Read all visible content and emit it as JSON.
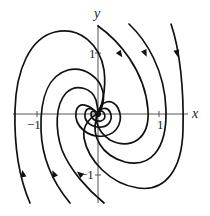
{
  "figure": {
    "axes": {
      "x_label": "x",
      "y_label": "y",
      "x_ticks": [
        {
          "value": -1,
          "label": "−1"
        },
        {
          "value": 1,
          "label": "1"
        }
      ],
      "y_ticks": [
        {
          "value": 1,
          "label": "1"
        },
        {
          "value": -1,
          "label": "−1"
        }
      ],
      "origin_px": [
        98,
        114
      ],
      "unit_px": 61,
      "x_range_px": [
        13,
        188
      ],
      "y_range_px": [
        25,
        203
      ]
    },
    "equilibrium": {
      "type": "spiral sink",
      "location": [
        0,
        0
      ]
    },
    "rotation": "counterclockwise",
    "colors": {
      "curve": "#111111",
      "axis": "#555555",
      "text": "#222222"
    },
    "trajectories": [
      {
        "id": "t1",
        "path": "M 98 26 C 118 40 145 70 148 110 C 150 140 130 150 110 140 C 95 130 95 116 98 114",
        "arrow": {
          "x": 120,
          "y": 54,
          "angle": 55
        }
      },
      {
        "id": "t2",
        "path": "M 129 24 C 146 40 165 70 166 110 C 167 150 150 168 125 162 C 100 155 92 135 96 120 C 97 116 98 114 98 114",
        "arrow": {
          "x": 145,
          "y": 53,
          "angle": 65
        }
      },
      {
        "id": "t3",
        "path": "M 171 24 C 180 50 184 90 183 130 C 182 170 165 192 138 188 C 110 184 88 160 84 138 C 82 124 92 116 98 114",
        "arrow": {
          "x": 177,
          "y": 53,
          "angle": 78
        }
      },
      {
        "id": "t4",
        "path": "M 30 203 C 20 180 14 150 15 110 C 16 70 30 38 55 32 C 80 26 100 45 104 70 C 107 92 100 110 98 114",
        "arrow": {
          "x": 23,
          "y": 174,
          "angle": -100
        }
      },
      {
        "id": "t5",
        "path": "M 70 203 C 55 185 42 160 41 130 C 40 95 50 75 68 70 C 85 66 100 78 103 92 C 105 104 100 112 98 114",
        "arrow": {
          "x": 54,
          "y": 174,
          "angle": -115
        }
      },
      {
        "id": "t6",
        "path": "M 104 203 C 88 190 70 170 62 150 C 55 130 55 105 66 93 C 76 83 92 88 96 100 C 98 108 98 112 98 114",
        "arrow": {
          "x": 80,
          "y": 174,
          "angle": -140
        }
      },
      {
        "id": "t7",
        "path": "M 98 114 C 90 105 78 100 76 112 C 74 126 88 138 104 136 C 118 134 124 120 118 108 C 112 98 100 100 98 114"
      },
      {
        "id": "t8",
        "path": "M 98 114 C 93 108 86 106 85 114 C 84 122 92 128 102 127 C 110 126 113 118 110 112 C 107 106 100 108 98 114"
      },
      {
        "id": "t9",
        "path": "M 98 114 C 95 111 91 110 91 114 C 91 119 96 122 101 121 C 105 120 106 116 104 113 C 102 110 99 111 98 114"
      }
    ],
    "center_blob": {
      "cx": 98,
      "cy": 114,
      "r": 3
    }
  }
}
